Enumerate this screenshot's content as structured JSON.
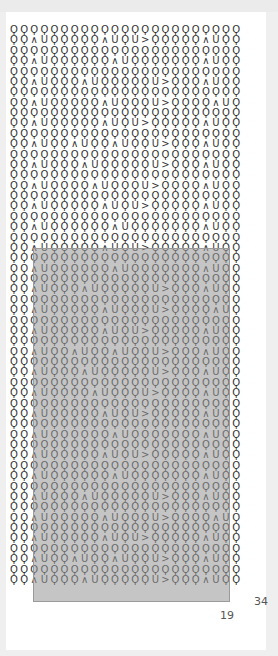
{
  "board": {
    "columns": 23,
    "rows": 54,
    "symbol_legend": {
      "O": "teardrop",
      "^": "caret-up",
      "U": "u-cup",
      ">": "chevron-right"
    },
    "odd_row_patterns": [
      "OO^UOOOOO^UOU>OOOOO^UOO",
      "OO^UOOOOOO^UOOOOOOO^UOO",
      "OO^UOOO^UOOOOOU>OOO^UOO",
      "OO^UOOOOO^UOOOU>OOOO^UOO",
      "OO^UOOOOO^UOU>OOOOO^UOO",
      "OO^UOO^UOO^UOOU>OOO^UOO",
      "OO^UOOO^UOOOOOU>OOO^UOO",
      "OO^UOOOO^UOOOU>OOOO^UOO",
      "OO^UOOOOO^UOU>OOOOO^UOO",
      "OO^UOOOOOO^UOOOOOOO^UOO"
    ]
  },
  "selection": {
    "start_col": 2,
    "start_row": 20,
    "width_cols": 19,
    "height_rows": 34,
    "fill_color": "#a0a0a0"
  },
  "labels": {
    "rows_count": "34",
    "cols_count": "19"
  }
}
